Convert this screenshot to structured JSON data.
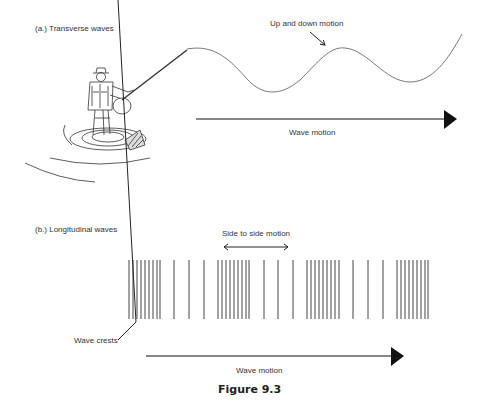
{
  "panel_a": {
    "label": "(a.)  Transverse waves",
    "annotation_top": "Up and down motion",
    "arrow_label": "Wave motion",
    "illustration": "fly-fisherman-standing-in-water-casting-line"
  },
  "panel_b": {
    "label": "(b.)  Longitudinal waves",
    "annotation_top": "Side to side motion",
    "crest_label": "Wave crests",
    "arrow_label": "Wave motion",
    "compression_groups": 4,
    "lines_per_compression": 9,
    "rarefaction_lines_between": 3
  },
  "caption": "Figure 9.3",
  "colors": {
    "line": "#555555",
    "arrow": "#111111",
    "background": "#ffffff"
  }
}
